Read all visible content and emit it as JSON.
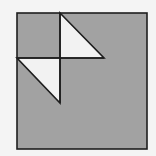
{
  "diagram": {
    "colors": {
      "background": "#f4f4f4",
      "square_fill": "#a2a2a2",
      "triangle_fill": "#f2f2f2",
      "stroke": "#1e1e1e"
    },
    "square": {
      "x": 17,
      "y": 13,
      "width": 130,
      "height": 136
    },
    "lines": [
      {
        "name": "vertical-divider",
        "x1": 60,
        "y1": 13,
        "x2": 60,
        "y2": 103
      },
      {
        "name": "horizontal-divider",
        "x1": 17,
        "y1": 58,
        "x2": 104,
        "y2": 58
      }
    ],
    "triangles": [
      {
        "name": "upper-triangle",
        "points": "60,13 104,58 60,58"
      },
      {
        "name": "lower-triangle",
        "points": "17,58 60,58 60,103"
      }
    ]
  }
}
